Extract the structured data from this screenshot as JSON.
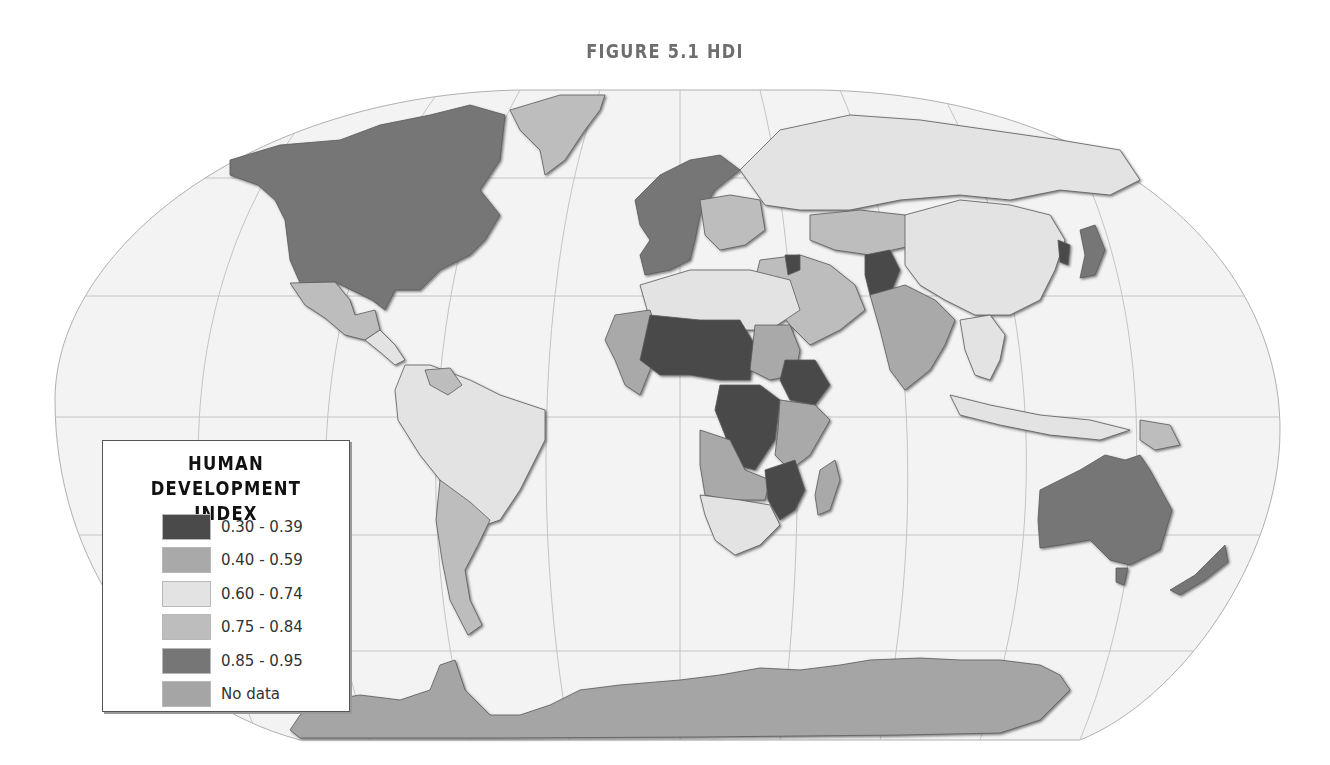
{
  "title": "FIGURE 5.1 HDI",
  "legend": {
    "title_line1": "HUMAN DEVELOPMENT",
    "title_line2": "INDEX",
    "items": [
      {
        "label": "0.30 - 0.39",
        "color": "#4a4a4a",
        "class": "c1"
      },
      {
        "label": "0.40 - 0.59",
        "color": "#a9a9a9",
        "class": "c2"
      },
      {
        "label": "0.60 - 0.74",
        "color": "#e3e3e3",
        "class": "c3"
      },
      {
        "label": "0.75 - 0.84",
        "color": "#bdbdbd",
        "class": "c4"
      },
      {
        "label": "0.85 - 0.95",
        "color": "#767676",
        "class": "c5"
      },
      {
        "label": "No data",
        "color": "#a5a5a5",
        "class": "c6"
      }
    ]
  },
  "colors": {
    "ocean": "#f3f3f3",
    "graticule": "#bdbdbd",
    "border": "#5a5a5a"
  },
  "regions": [
    {
      "name": "North America (US/Canada)",
      "hdi_class": "0.85 - 0.95"
    },
    {
      "name": "Greenland",
      "hdi_class": "0.75 - 0.84"
    },
    {
      "name": "Mexico",
      "hdi_class": "0.75 - 0.84"
    },
    {
      "name": "Central America",
      "hdi_class": "0.60 - 0.74"
    },
    {
      "name": "Brazil / Northern South America",
      "hdi_class": "0.60 - 0.74"
    },
    {
      "name": "Argentina / Chile / Uruguay",
      "hdi_class": "0.75 - 0.84"
    },
    {
      "name": "Venezuela",
      "hdi_class": "0.75 - 0.84"
    },
    {
      "name": "Western Europe / Scandinavia",
      "hdi_class": "0.85 - 0.95"
    },
    {
      "name": "Eastern Europe",
      "hdi_class": "0.75 - 0.84"
    },
    {
      "name": "Russia",
      "hdi_class": "0.60 - 0.74"
    },
    {
      "name": "Kazakhstan",
      "hdi_class": "0.75 - 0.84"
    },
    {
      "name": "China / Mongolia",
      "hdi_class": "0.60 - 0.74"
    },
    {
      "name": "Japan / South Korea",
      "hdi_class": "0.85 - 0.95"
    },
    {
      "name": "North Korea",
      "hdi_class": "No data"
    },
    {
      "name": "Afghanistan",
      "hdi_class": "0.30 - 0.39"
    },
    {
      "name": "Iraq",
      "hdi_class": "0.30 - 0.39"
    },
    {
      "name": "India / South Asia",
      "hdi_class": "0.40 - 0.59"
    },
    {
      "name": "Middle East / Arabia",
      "hdi_class": "0.75 - 0.84"
    },
    {
      "name": "North Africa",
      "hdi_class": "0.60 - 0.74"
    },
    {
      "name": "Sahel (Mali, Niger, Chad)",
      "hdi_class": "0.30 - 0.39"
    },
    {
      "name": "Ethiopia",
      "hdi_class": "0.30 - 0.39"
    },
    {
      "name": "DR Congo / Central Africa",
      "hdi_class": "0.30 - 0.39"
    },
    {
      "name": "Mozambique / Malawi",
      "hdi_class": "0.30 - 0.39"
    },
    {
      "name": "Southern Africa",
      "hdi_class": "0.60 - 0.74"
    },
    {
      "name": "East / West Africa (other)",
      "hdi_class": "0.40 - 0.59"
    },
    {
      "name": "Madagascar",
      "hdi_class": "0.40 - 0.59"
    },
    {
      "name": "Southeast Asia",
      "hdi_class": "0.60 - 0.74"
    },
    {
      "name": "Australia",
      "hdi_class": "0.85 - 0.95"
    },
    {
      "name": "New Zealand",
      "hdi_class": "0.85 - 0.95"
    },
    {
      "name": "Antarctica",
      "hdi_class": "No data"
    }
  ]
}
